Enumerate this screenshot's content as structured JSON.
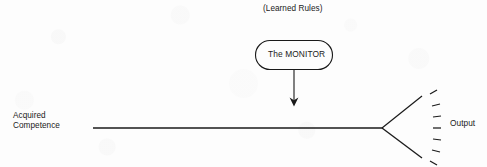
{
  "diagram": {
    "background_color": "#fdfdfd",
    "ink_color": "#1a1a1a",
    "top_annotation": {
      "text": "(Learned Rules)"
    },
    "monitor_node": {
      "label": "The MONITOR",
      "shape": "rounded-rectangle"
    },
    "arrow": {
      "direction": "down",
      "from": "monitor-node",
      "to": "acquired-competence-line"
    },
    "left_label": {
      "line1": "Acquired",
      "line2": "Competence",
      "text": "Acquired\nCompetence"
    },
    "flow_line": {
      "orientation": "horizontal"
    },
    "output_fan": {
      "label": "Output",
      "solid_ray_count": 2,
      "dash_count": 7
    }
  }
}
